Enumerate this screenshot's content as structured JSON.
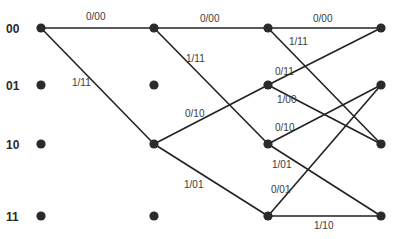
{
  "diagram": {
    "type": "trellis",
    "states": [
      "00",
      "01",
      "10",
      "11"
    ],
    "columns_x": [
      41,
      154,
      268,
      381
    ],
    "rows_y": [
      28,
      85,
      144,
      216
    ],
    "colors": {
      "line": "#222222",
      "node": "#2b2b2b",
      "text": "#2a2a2a"
    },
    "edges": [
      {
        "from": [
          0,
          0
        ],
        "to": [
          1,
          0
        ],
        "label": "0/00",
        "lx": 86,
        "ly": 20
      },
      {
        "from": [
          0,
          0
        ],
        "to": [
          1,
          2
        ],
        "label": "1/11",
        "lx": 72,
        "ly": 86
      },
      {
        "from": [
          1,
          0
        ],
        "to": [
          2,
          0
        ],
        "label": "0/00",
        "lx": 200,
        "ly": 22
      },
      {
        "from": [
          1,
          0
        ],
        "to": [
          2,
          2
        ],
        "label": "1/11",
        "lx": 186,
        "ly": 62
      },
      {
        "from": [
          1,
          2
        ],
        "to": [
          2,
          1
        ],
        "label": "0/10",
        "lx": 185,
        "ly": 117
      },
      {
        "from": [
          1,
          2
        ],
        "to": [
          2,
          3
        ],
        "label": "1/01",
        "lx": 184,
        "ly": 188
      },
      {
        "from": [
          2,
          0
        ],
        "to": [
          3,
          0
        ],
        "label": "0/00",
        "lx": 313,
        "ly": 22
      },
      {
        "from": [
          2,
          0
        ],
        "to": [
          3,
          2
        ],
        "label": "1/11",
        "lx": 289,
        "ly": 45
      },
      {
        "from": [
          2,
          1
        ],
        "to": [
          3,
          0
        ],
        "label": "0/11",
        "lx": 275,
        "ly": 75
      },
      {
        "from": [
          2,
          1
        ],
        "to": [
          3,
          2
        ],
        "label": "1/00",
        "lx": 277,
        "ly": 103
      },
      {
        "from": [
          2,
          2
        ],
        "to": [
          3,
          1
        ],
        "label": "0/10",
        "lx": 275,
        "ly": 131
      },
      {
        "from": [
          2,
          2
        ],
        "to": [
          3,
          3
        ],
        "label": "1/01",
        "lx": 272,
        "ly": 168
      },
      {
        "from": [
          2,
          3
        ],
        "to": [
          3,
          1
        ],
        "label": "0/01",
        "lx": 271,
        "ly": 193
      },
      {
        "from": [
          2,
          3
        ],
        "to": [
          3,
          3
        ],
        "label": "1/10",
        "lx": 314,
        "ly": 229
      }
    ],
    "inactive_nodes": [
      [
        1,
        1
      ],
      [
        1,
        3
      ]
    ]
  }
}
